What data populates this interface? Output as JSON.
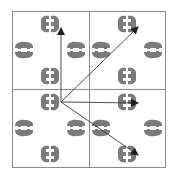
{
  "diagram": {
    "type": "tiling-translation-diagram",
    "colors": {
      "background": "#ffffff",
      "grid": "#808080",
      "motif": "#7a7a7a",
      "arrow": "#3a3a3a"
    },
    "grid": {
      "rows": 2,
      "cols": 2,
      "outer": {
        "x": 12,
        "y": 11,
        "w": 153,
        "h": 156
      },
      "divider_x": 89,
      "divider_y": 89
    },
    "tiles": [
      {
        "id": "top-left",
        "cx": 50,
        "cy": 50
      },
      {
        "id": "top-right",
        "cx": 127,
        "cy": 50
      },
      {
        "id": "bottom-left",
        "cx": 50,
        "cy": 128
      },
      {
        "id": "bottom-right",
        "cx": 127,
        "cy": 128
      }
    ],
    "motif": {
      "description": "ring of animal silhouettes (pairs facing each other) around a blank center",
      "positions": [
        "top",
        "right",
        "bottom",
        "left"
      ]
    },
    "arrows": {
      "origin": {
        "x": 61,
        "y": 102
      },
      "targets": [
        {
          "id": "up",
          "x": 61,
          "y": 28
        },
        {
          "id": "up-right",
          "x": 138,
          "y": 27
        },
        {
          "id": "right",
          "x": 138,
          "y": 103
        },
        {
          "id": "down-right",
          "x": 138,
          "y": 155
        }
      ]
    }
  }
}
